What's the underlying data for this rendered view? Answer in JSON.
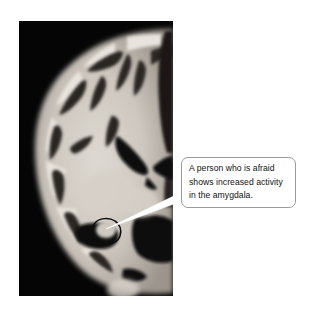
{
  "figure": {
    "type": "mri-coronal-brain-scan",
    "modality": "MRI",
    "view": "coronal",
    "background_color": "#000000",
    "frame": {
      "left": 19,
      "top": 21,
      "width": 154,
      "height": 275
    },
    "annotation_marker": {
      "name": "amygdala-outline",
      "shape": "hand-drawn-closed-outline",
      "center_x": 105,
      "center_y": 229,
      "stroke_color": "#000000"
    }
  },
  "callout": {
    "lines": [
      "A person who is afraid",
      "shows increased activity",
      "in the amygdala."
    ],
    "full_text": "A person who is afraid shows increased activity in the amygdala.",
    "border_color": "#9a9a9a",
    "fill_color": "#ffffff",
    "text_color": "#111111",
    "leader_color": "#ffffff"
  },
  "page": {
    "background_color": "#ffffff",
    "width": 310,
    "height": 313
  }
}
